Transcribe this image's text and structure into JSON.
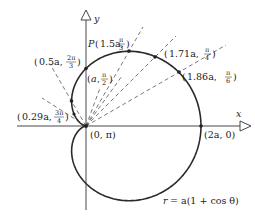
{
  "figure": {
    "equation": {
      "lhs": "r",
      "rhs": "= a(1 + cos θ)"
    },
    "axes": {
      "x_label": "x",
      "y_label": "y"
    },
    "colors": {
      "curve": "#2a2a2a",
      "axis": "#333333",
      "rays": "#555555"
    },
    "points": [
      {
        "id": "origin",
        "label": "(0, π)",
        "r": "0",
        "theta": "π"
      },
      {
        "id": "p-2a-0",
        "label": "(2a, 0)",
        "r": "2a",
        "theta": "0"
      },
      {
        "id": "p-186",
        "r": "1.86a",
        "theta_num": "π",
        "theta_den": "6"
      },
      {
        "id": "p-171",
        "r": "1.71a",
        "theta_num": "π",
        "theta_den": "4"
      },
      {
        "id": "p-P",
        "prefix": "P",
        "r": "1.5a",
        "theta_num": "π",
        "theta_den": "3"
      },
      {
        "id": "p-a",
        "r": "a",
        "theta_num": "π",
        "theta_den": "2"
      },
      {
        "id": "p-05",
        "r": "0.5a",
        "theta_num": "2π",
        "theta_den": "3"
      },
      {
        "id": "p-029",
        "r": "0.29a",
        "theta_num": "3π",
        "theta_den": "4"
      }
    ]
  }
}
